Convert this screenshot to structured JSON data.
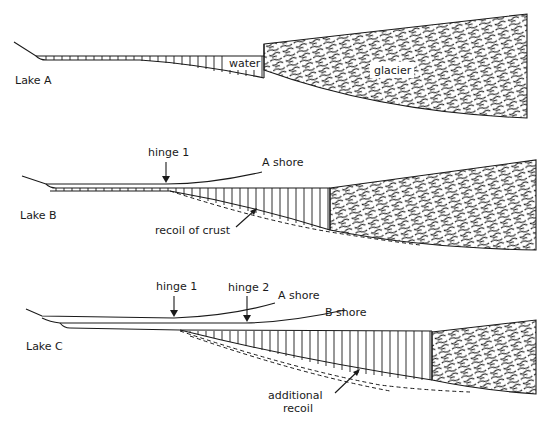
{
  "figure": {
    "panels": [
      {
        "id": "lake-a",
        "label": "Lake A",
        "annotations": {
          "water": "water",
          "glacier": "glacier"
        }
      },
      {
        "id": "lake-b",
        "label": "Lake B",
        "annotations": {
          "hinge": "hinge 1",
          "shore": "A shore",
          "recoil": "recoil of crust"
        }
      },
      {
        "id": "lake-c",
        "label": "Lake C",
        "annotations": {
          "hinge1": "hinge 1",
          "hinge2": "hinge 2",
          "shoreA": "A shore",
          "shoreB": "B shore",
          "recoil_line1": "additional",
          "recoil_line2": "recoil"
        }
      }
    ],
    "colors": {
      "ink": "#1a1a1a",
      "background": "#ffffff"
    }
  }
}
